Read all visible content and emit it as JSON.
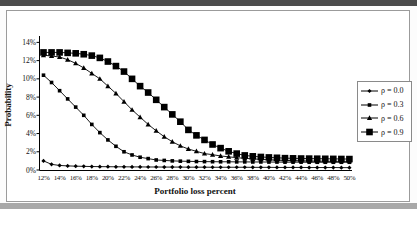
{
  "figure": {
    "y_axis_title": "Probability",
    "x_axis_title": "Portfolio loss percent",
    "y_tick_labels": [
      "0%",
      "2%",
      "4%",
      "6%",
      "8%",
      "10%",
      "12%",
      "14%"
    ],
    "x_tick_labels": [
      "12%",
      "14%",
      "16%",
      "18%",
      "20%",
      "22%",
      "24%",
      "26%",
      "28%",
      "30%",
      "32%",
      "34%",
      "36%",
      "38%",
      "40%",
      "42%",
      "44%",
      "46%",
      "48%",
      "50%"
    ],
    "legend_entries": [
      {
        "label": "ρ = 0.0",
        "marker": "diamond"
      },
      {
        "label": "ρ = 0.3",
        "marker": "square-small"
      },
      {
        "label": "ρ = 0.6",
        "marker": "triangle"
      },
      {
        "label": "ρ = 0.9",
        "marker": "square-large"
      }
    ]
  },
  "colors": {
    "line": "#000000",
    "text": "#111111",
    "frame_border": "#9b9b9b",
    "top_band": "#4a4a4a",
    "bottom_band": "#a8a8a8"
  },
  "chart_data": {
    "type": "line",
    "title": "",
    "xlabel": "Portfolio loss percent",
    "ylabel": "Probability",
    "x_unit": "percent",
    "ylim": [
      0,
      14
    ],
    "y_ticks": [
      0,
      2,
      4,
      6,
      8,
      10,
      12,
      14
    ],
    "grid": false,
    "legend_position": "right",
    "x": [
      12,
      13,
      14,
      15,
      16,
      17,
      18,
      19,
      20,
      21,
      22,
      23,
      24,
      25,
      26,
      27,
      28,
      29,
      30,
      31,
      32,
      33,
      34,
      35,
      36,
      37,
      38,
      39,
      40,
      41,
      42,
      43,
      44,
      45,
      46,
      47,
      48,
      49,
      50
    ],
    "series": [
      {
        "name": "ρ = 0.0",
        "marker": "diamond",
        "values": [
          1.0,
          0.62,
          0.5,
          0.45,
          0.42,
          0.4,
          0.38,
          0.37,
          0.36,
          0.35,
          0.35,
          0.34,
          0.34,
          0.33,
          0.33,
          0.32,
          0.32,
          0.32,
          0.31,
          0.31,
          0.31,
          0.3,
          0.3,
          0.3,
          0.3,
          0.3,
          0.29,
          0.29,
          0.29,
          0.28,
          0.28,
          0.28,
          0.28,
          0.27,
          0.27,
          0.27,
          0.27,
          0.26,
          0.26
        ]
      },
      {
        "name": "ρ = 0.3",
        "marker": "square-small",
        "values": [
          10.4,
          9.6,
          8.7,
          7.8,
          6.9,
          6.0,
          5.0,
          4.1,
          3.3,
          2.6,
          2.0,
          1.65,
          1.4,
          1.25,
          1.1,
          1.05,
          1.0,
          0.97,
          0.95,
          0.93,
          0.92,
          0.91,
          0.9,
          0.9,
          0.89,
          0.89,
          0.88,
          0.88,
          0.87,
          0.87,
          0.86,
          0.86,
          0.86,
          0.85,
          0.85,
          0.85,
          0.85,
          0.85,
          0.85
        ]
      },
      {
        "name": "ρ = 0.6",
        "marker": "triangle",
        "values": [
          12.6,
          12.5,
          12.4,
          12.1,
          11.7,
          11.2,
          10.6,
          10.0,
          9.2,
          8.4,
          7.5,
          6.6,
          5.8,
          5.0,
          4.3,
          3.65,
          3.1,
          2.65,
          2.3,
          2.05,
          1.8,
          1.68,
          1.54,
          1.45,
          1.35,
          1.28,
          1.22,
          1.17,
          1.12,
          1.08,
          1.05,
          1.03,
          1.0,
          0.98,
          0.97,
          0.96,
          0.95,
          0.95,
          0.95
        ]
      },
      {
        "name": "ρ = 0.9",
        "marker": "square-large",
        "values": [
          12.9,
          12.9,
          12.9,
          12.85,
          12.8,
          12.7,
          12.55,
          12.3,
          11.9,
          11.4,
          10.8,
          10.0,
          9.2,
          8.5,
          7.7,
          6.9,
          6.1,
          5.3,
          4.4,
          3.8,
          3.3,
          2.8,
          2.4,
          2.05,
          1.8,
          1.6,
          1.5,
          1.43,
          1.38,
          1.34,
          1.3,
          1.28,
          1.26,
          1.25,
          1.24,
          1.23,
          1.22,
          1.21,
          1.2
        ]
      }
    ]
  }
}
